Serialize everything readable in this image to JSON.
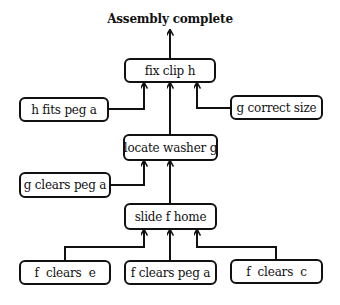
{
  "diagram": {
    "title": "Assembly complete",
    "nodes": {
      "fix_clip": {
        "label": "fix clip h"
      },
      "h_fits": {
        "label": "h fits peg a"
      },
      "g_correct": {
        "label": "g correct size"
      },
      "locate_washer": {
        "label": "locate washer g"
      },
      "g_clears": {
        "label": "g clears peg a"
      },
      "slide_home": {
        "label": "slide f home"
      },
      "f_clears_e": {
        "label": "f  clears  e"
      },
      "f_clears_peg": {
        "label": "f clears peg a"
      },
      "f_clears_c": {
        "label": "f  clears  c"
      }
    },
    "edges": [
      {
        "from": "fix_clip",
        "to": "title"
      },
      {
        "from": "h_fits",
        "to": "fix_clip"
      },
      {
        "from": "locate_washer",
        "to": "fix_clip"
      },
      {
        "from": "g_correct",
        "to": "fix_clip"
      },
      {
        "from": "g_clears",
        "to": "locate_washer"
      },
      {
        "from": "slide_home",
        "to": "locate_washer"
      },
      {
        "from": "f_clears_e",
        "to": "slide_home"
      },
      {
        "from": "f_clears_peg",
        "to": "slide_home"
      },
      {
        "from": "f_clears_c",
        "to": "slide_home"
      }
    ],
    "colors": {
      "stroke": "#111111",
      "background": "#ffffff"
    }
  }
}
